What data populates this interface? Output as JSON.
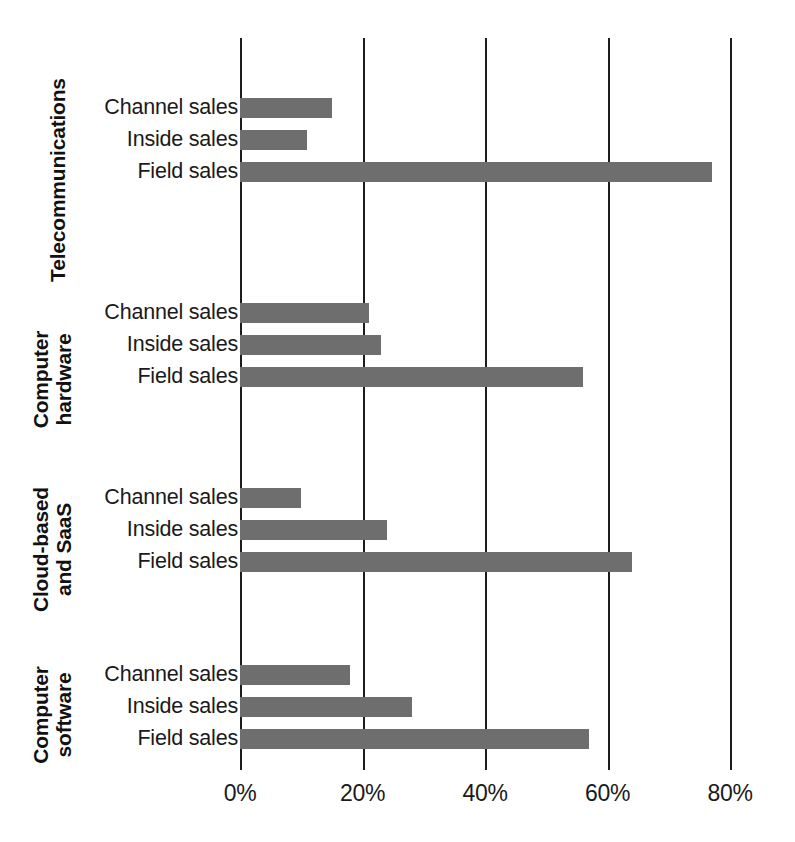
{
  "chart_data": {
    "type": "bar",
    "orientation": "horizontal",
    "title": "",
    "subtitle": "",
    "xlabel": "",
    "ylabel": "",
    "xlim": [
      0,
      80
    ],
    "xticks": [
      0,
      20,
      40,
      60,
      80
    ],
    "xtick_labels": [
      "0%",
      "20%",
      "40%",
      "60%",
      "80%"
    ],
    "grid": true,
    "legend": "none",
    "series_names": [
      "Channel sales",
      "Inside sales",
      "Field sales"
    ],
    "groups": [
      {
        "category": "Telecommunications",
        "category_lines": [
          "Telecommunications"
        ],
        "bars": [
          {
            "label": "Channel sales",
            "value": 15
          },
          {
            "label": "Inside sales",
            "value": 11
          },
          {
            "label": "Field sales",
            "value": 77
          }
        ]
      },
      {
        "category": "Computer hardware",
        "category_lines": [
          "Computer",
          "hardware"
        ],
        "bars": [
          {
            "label": "Channel sales",
            "value": 21
          },
          {
            "label": "Inside sales",
            "value": 23
          },
          {
            "label": "Field sales",
            "value": 56
          }
        ]
      },
      {
        "category": "Cloud-based and SaaS",
        "category_lines": [
          "Cloud-based",
          "and SaaS"
        ],
        "bars": [
          {
            "label": "Channel sales",
            "value": 10
          },
          {
            "label": "Inside sales",
            "value": 24
          },
          {
            "label": "Field sales",
            "value": 64
          }
        ]
      },
      {
        "category": "Computer software",
        "category_lines": [
          "Computer",
          "software"
        ],
        "bars": [
          {
            "label": "Channel sales",
            "value": 18
          },
          {
            "label": "Inside sales",
            "value": 28
          },
          {
            "label": "Field sales",
            "value": 57
          }
        ]
      }
    ],
    "colors": {
      "bar": "#6e6e6e",
      "gridline": "#1c1c1c",
      "text": "#1a1a1a",
      "background": "#ffffff"
    }
  }
}
